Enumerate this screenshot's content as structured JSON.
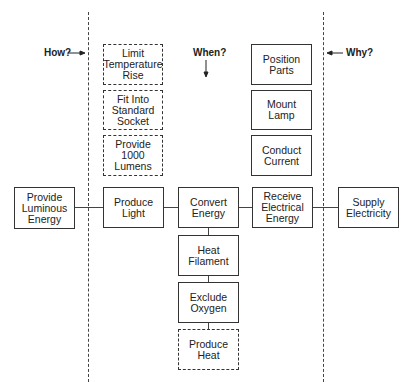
{
  "diagram": {
    "type": "FAST diagram",
    "labels": {
      "how": "How?",
      "when": "When?",
      "why": "Why?"
    },
    "boxes": {
      "limit_temperature_rise": {
        "label": "Limit\nTemperature\nRise",
        "style": "dashed"
      },
      "fit_into_standard_socket": {
        "label": "Fit Into\nStandard\nSocket",
        "style": "dashed"
      },
      "provide_1000_lumens": {
        "label": "Provide\n1000\nLumens",
        "style": "dashed"
      },
      "position_parts": {
        "label": "Position\nParts",
        "style": "solid"
      },
      "mount_lamp": {
        "label": "Mount\nLamp",
        "style": "solid"
      },
      "conduct_current": {
        "label": "Conduct\nCurrent",
        "style": "solid"
      },
      "provide_luminous_energy": {
        "label": "Provide\nLuminous\nEnergy",
        "style": "solid"
      },
      "produce_light": {
        "label": "Produce\nLight",
        "style": "solid"
      },
      "convert_energy": {
        "label": "Convert\nEnergy",
        "style": "solid"
      },
      "receive_electrical_energy": {
        "label": "Receive\nElectrical\nEnergy",
        "style": "solid"
      },
      "supply_electricity": {
        "label": "Supply\nElectricity",
        "style": "solid"
      },
      "heat_filament": {
        "label": "Heat\nFilament",
        "style": "solid"
      },
      "exclude_oxygen": {
        "label": "Exclude\nOxygen",
        "style": "solid"
      },
      "produce_heat": {
        "label": "Produce\nHeat",
        "style": "dashed"
      }
    },
    "connections": [
      [
        "provide_luminous_energy",
        "produce_light"
      ],
      [
        "produce_light",
        "convert_energy"
      ],
      [
        "convert_energy",
        "receive_electrical_energy"
      ],
      [
        "receive_electrical_energy",
        "supply_electricity"
      ],
      [
        "convert_energy",
        "heat_filament"
      ],
      [
        "heat_filament",
        "exclude_oxygen"
      ],
      [
        "exclude_oxygen",
        "produce_heat"
      ]
    ]
  }
}
